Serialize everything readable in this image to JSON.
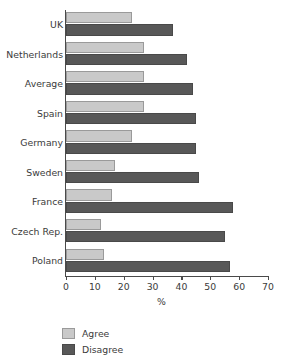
{
  "chart_data": {
    "type": "bar",
    "orientation": "horizontal",
    "title": "",
    "xlabel": "%",
    "ylabel": "",
    "xlim": [
      0,
      70
    ],
    "xticks": [
      0,
      10,
      20,
      30,
      40,
      50,
      60,
      70
    ],
    "grid": false,
    "legend_position": "bottom-left",
    "categories": [
      "UK",
      "Netherlands",
      "Average",
      "Spain",
      "Germany",
      "Sweden",
      "France",
      "Czech Rep.",
      "Poland"
    ],
    "series": [
      {
        "name": "Agree",
        "color": "#c9c9c9",
        "values": [
          23,
          27,
          27,
          27,
          23,
          17,
          16,
          12,
          13
        ]
      },
      {
        "name": "Disagree",
        "color": "#585858",
        "values": [
          37,
          42,
          44,
          45,
          45,
          46,
          58,
          55,
          57
        ]
      }
    ]
  },
  "legend": {
    "items": [
      {
        "label": "Agree",
        "color": "#c9c9c9"
      },
      {
        "label": "Disagree",
        "color": "#585858"
      }
    ]
  },
  "axis": {
    "x_title": "%",
    "tick_labels": [
      "0",
      "10",
      "20",
      "30",
      "40",
      "50",
      "60",
      "70"
    ]
  },
  "colors": {
    "agree": "#c9c9c9",
    "disagree": "#585858",
    "axis": "#4a4a4a",
    "text": "#3b3b3b",
    "background": "#ffffff"
  }
}
